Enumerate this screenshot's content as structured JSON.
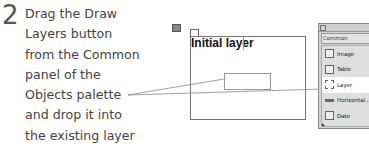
{
  "step": {
    "number": "2",
    "lines": [
      "Drag the Draw",
      "Layers button",
      "from the Common",
      "panel of the",
      "Objects palette",
      "and drop it into",
      "the existing layer"
    ]
  },
  "canvas": {
    "layer_label": "Initial layer"
  },
  "palette": {
    "tab_label": "Common",
    "items": [
      {
        "label": "Image",
        "icon": "image-icon"
      },
      {
        "label": "Table",
        "icon": "table-icon"
      },
      {
        "label": "Layer",
        "icon": "layer-icon",
        "selected": true
      },
      {
        "label": "Horizontal...",
        "icon": "horizontal-rule-icon"
      },
      {
        "label": "Date",
        "icon": "date-icon"
      }
    ]
  },
  "colors": {
    "text": "#444444",
    "palette_bg": "#d4d4d4",
    "callout_line": "#888888"
  }
}
